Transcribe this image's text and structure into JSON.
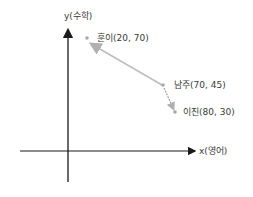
{
  "diagram": {
    "axes": {
      "x_label": "x(영어)",
      "y_label": "y(수학)"
    },
    "points": [
      {
        "name": "훈이",
        "label": "훈이(20, 70)",
        "x": 20,
        "y": 70
      },
      {
        "name": "남주",
        "label": "남주(70, 45)",
        "x": 70,
        "y": 45
      },
      {
        "name": "이진",
        "label": "이진(80, 30)",
        "x": 80,
        "y": 30
      }
    ],
    "arrows": [
      {
        "from": "남주",
        "to": "훈이"
      },
      {
        "from": "남주",
        "to": "이진"
      }
    ],
    "colors": {
      "axis": "#1a1a1a",
      "arrow": "#b8b8b8",
      "point": "#a8a8a8"
    }
  }
}
